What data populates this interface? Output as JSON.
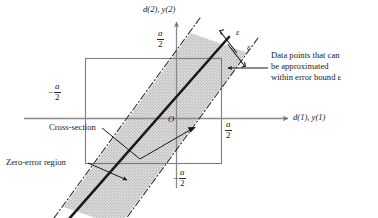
{
  "figure": {
    "type": "diagram",
    "axes": {
      "x_axis_label": "d(1), y(1)",
      "y_axis_label": "d(2), y(2)",
      "origin_label": "O",
      "x_positive_tick_label": {
        "sign": "",
        "numerator": "a",
        "denominator": "2"
      },
      "x_negative_tick_label": {
        "sign": "−",
        "numerator": "a",
        "denominator": "2"
      },
      "y_positive_tick_label": {
        "sign": "",
        "numerator": "a",
        "denominator": "2"
      },
      "y_negative_tick_label": {
        "sign": "−",
        "numerator": "a",
        "denominator": "2"
      },
      "axis_color": "#8a8a8a",
      "grid": false
    },
    "annotations": {
      "cross_section": "Cross-section",
      "zero_error_region": "Zero-error region",
      "data_points_note": "Data points that can\nbe approximated\nwithin error bound ε",
      "epsilon_upper": "ε",
      "epsilon_lower": "ε"
    },
    "colors": {
      "band_fill": "#d2d2d2",
      "band_border": "#2b2b2b",
      "cross_section_line": "#1a1a1a",
      "square_border": "#7d7d7d",
      "text": "#1a1a1a"
    }
  }
}
